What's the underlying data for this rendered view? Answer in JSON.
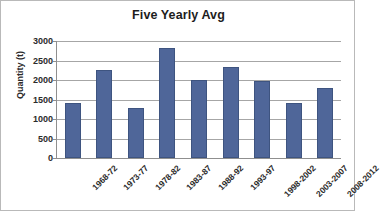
{
  "chart_data": {
    "type": "bar",
    "title": "Five Yearly Avg",
    "xlabel": "",
    "ylabel": "Quantity (t)",
    "categories": [
      "1968-72",
      "1973-77",
      "1978-82",
      "1983-87",
      "1988-92",
      "1993-97",
      "1998-2002",
      "2003-2007",
      "2008-2012"
    ],
    "values": [
      1400,
      2250,
      1270,
      2830,
      2010,
      2330,
      1980,
      1410,
      1790
    ],
    "ylim": [
      0,
      3000
    ],
    "ytick_step": 500,
    "ytick_labels": [
      "3000",
      "2500",
      "2000",
      "1500",
      "1000",
      "500",
      "0"
    ],
    "ytick_values": [
      3000,
      2500,
      2000,
      1500,
      1000,
      500,
      0
    ],
    "grid": true,
    "legend": false,
    "legend_position": "none",
    "bar_color": "#4f6699",
    "bar_border_color": "#3e5480",
    "gridline_color": "#a6a6a6",
    "axis_color": "#8f8f8f",
    "frame_color": "#b9b9b9",
    "text_color": "#2b2b2b",
    "title_color": "#1d1d1d"
  }
}
